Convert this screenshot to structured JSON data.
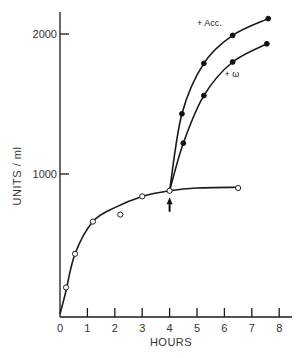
{
  "chart_data": {
    "type": "line",
    "title": "",
    "xlabel": "HOURS",
    "ylabel": "UNITS / ml",
    "xlim": [
      0,
      8.3
    ],
    "ylim": [
      0,
      2150
    ],
    "x_ticks": [
      0,
      1,
      2,
      3,
      4,
      5,
      6,
      7,
      8
    ],
    "x_tick_labels": [
      "0",
      "1",
      "2",
      "3",
      "4",
      "5",
      "6",
      "7",
      "8"
    ],
    "y_ticks": [
      1000,
      2000
    ],
    "y_tick_labels": [
      "1000",
      "2000"
    ],
    "grid": false,
    "legend": "none (inline curve annotations)",
    "series": [
      {
        "name": "control",
        "marker": "open-circle",
        "points": [
          [
            0.22,
            190
          ],
          [
            0.55,
            430
          ],
          [
            1.2,
            660
          ],
          [
            2.2,
            710
          ],
          [
            3.0,
            840
          ],
          [
            4.0,
            880
          ],
          [
            6.5,
            900
          ]
        ],
        "curve": [
          [
            0,
            0
          ],
          [
            0.2,
            150
          ],
          [
            0.55,
            430
          ],
          [
            1.2,
            660
          ],
          [
            2.0,
            760
          ],
          [
            3.0,
            840
          ],
          [
            4.0,
            880
          ],
          [
            5.0,
            900
          ],
          [
            6.5,
            905
          ]
        ]
      },
      {
        "name": "+ Acc.",
        "marker": "closed-circle",
        "points": [
          [
            4.45,
            1430
          ],
          [
            5.25,
            1790
          ],
          [
            6.3,
            1990
          ],
          [
            7.6,
            2110
          ]
        ],
        "curve": [
          [
            4.0,
            880
          ],
          [
            4.45,
            1430
          ],
          [
            5.25,
            1790
          ],
          [
            6.3,
            1990
          ],
          [
            7.6,
            2110
          ]
        ]
      },
      {
        "name": "+ ω",
        "marker": "closed-circle",
        "points": [
          [
            4.5,
            1220
          ],
          [
            5.25,
            1560
          ],
          [
            6.3,
            1800
          ],
          [
            7.55,
            1930
          ]
        ],
        "curve": [
          [
            4.0,
            880
          ],
          [
            4.5,
            1220
          ],
          [
            5.25,
            1560
          ],
          [
            6.3,
            1800
          ],
          [
            7.55,
            1930
          ]
        ]
      }
    ],
    "annotations": [
      {
        "text": "+ Acc.",
        "x": 5.0,
        "y": 2060
      },
      {
        "text": "+ ω",
        "x": 6.0,
        "y": 1690
      },
      {
        "type": "arrow",
        "x": 4.0,
        "y_from": 730,
        "y_to": 820,
        "direction": "up",
        "meaning": "addition at 4 hours"
      }
    ]
  },
  "labels": {
    "xlabel": "HOURS",
    "ylabel": "UNITS / ml",
    "acc": "+ Acc.",
    "omega": "+ ω"
  }
}
